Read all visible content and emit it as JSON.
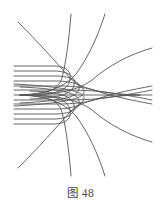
{
  "figure": {
    "caption": "图 48",
    "caption_label": "图",
    "caption_number": "48",
    "diagram_type": "streamline-field-diagram",
    "background_color": "#ffffff",
    "stroke_color": "#555555",
    "stroke_width": 0.9,
    "canvas": {
      "width": 161,
      "height": 206
    },
    "plot_area": {
      "x": 0,
      "y": 0,
      "width": 161,
      "height": 172
    },
    "symmetry_axis_y": 95,
    "saddle_point": {
      "x": 72,
      "y": 95
    }
  },
  "chart_data": {
    "type": "line",
    "title": "图 48",
    "xlabel": "",
    "ylabel": "",
    "grid": false,
    "legend": false,
    "xlim": [
      0,
      161
    ],
    "ylim": [
      0,
      172
    ],
    "axis_line": {
      "name": "central-horizontal-axis",
      "x_start": 14,
      "x_end": 152,
      "y": 95
    },
    "series": [
      {
        "name": "streamline-upper-1",
        "path": "M 14 66 L 54 66 C 66 66 72 72 70 80 C 68 89 60 93 42 94"
      },
      {
        "name": "streamline-upper-2",
        "path": "M 14 71 L 54 71 C 68 71 76 77 74 85 C 72 94 60 98 30 99"
      },
      {
        "name": "streamline-upper-3",
        "path": "M 14 76 L 55 76 C 72 76 80 82 79 89 C 78 96 66 101 20 103"
      },
      {
        "name": "streamline-upper-4",
        "path": "M 14 81 L 56 81 C 74 81 84 86 84 92 C 84 97 72 103 14 106"
      },
      {
        "name": "streamline-upper-5",
        "path": "M 14 86 L 58 86 C 80 86 92 89 100 92 C 112 96 130 100 152 104"
      },
      {
        "name": "streamline-upper-6",
        "path": "M 14 90 L 60 90 C 84 90 100 91 112 93 C 126 95 142 98 152 100"
      },
      {
        "name": "streamline-lower-1",
        "path": "M 14 124 L 54 124 C 66 124 72 118 70 110 C 68 101 60 97 42 96"
      },
      {
        "name": "streamline-lower-2",
        "path": "M 14 119 L 54 119 C 68 119 76 113 74 105 C 72 96 60 92 30 91"
      },
      {
        "name": "streamline-lower-3",
        "path": "M 14 114 L 55 114 C 72 114 80 108 79 101 C 78 94 66 89 20 87"
      },
      {
        "name": "streamline-lower-4",
        "path": "M 14 109 L 56 109 C 74 109 84 104 84 98 C 84 93 72 87 14 84"
      },
      {
        "name": "streamline-lower-5",
        "path": "M 14 104 L 58 104 C 80 104 92 101 100 98 C 112 94 130 90 152 86"
      },
      {
        "name": "streamline-lower-6",
        "path": "M 14 100 L 60 100 C 84 100 100 99 112 97 C 126 95 142 92 152 90"
      },
      {
        "name": "outer-curve-upper-steep",
        "path": "M 71 14 C 69 40 66 62 62 78 C 58 90 48 94 22 95"
      },
      {
        "name": "outer-curve-upper-diagonal",
        "path": "M 105 14 C 98 36 88 58 76 74 C 64 88 46 94 20 95"
      },
      {
        "name": "outer-curve-upper-right",
        "path": "M 152 48 C 130 54 108 66 92 80 C 76 92 52 95 20 95"
      },
      {
        "name": "outer-curve-upper-left-diagonal",
        "path": "M 18 22 C 38 42 56 62 70 78 C 82 90 104 94 140 95"
      },
      {
        "name": "outer-curve-lower-steep",
        "path": "M 71 176 C 69 150 66 128 62 112 C 58 100 48 96 22 95"
      },
      {
        "name": "outer-curve-lower-diagonal",
        "path": "M 105 176 C 98 154 88 132 76 116 C 64 102 46 96 20 95"
      },
      {
        "name": "outer-curve-lower-right",
        "path": "M 152 142 C 130 136 108 124 92 110 C 76 98 52 95 20 95"
      },
      {
        "name": "outer-curve-lower-left-diagonal",
        "path": "M 18 168 C 38 148 56 128 70 112 C 82 100 104 96 140 95"
      }
    ]
  }
}
